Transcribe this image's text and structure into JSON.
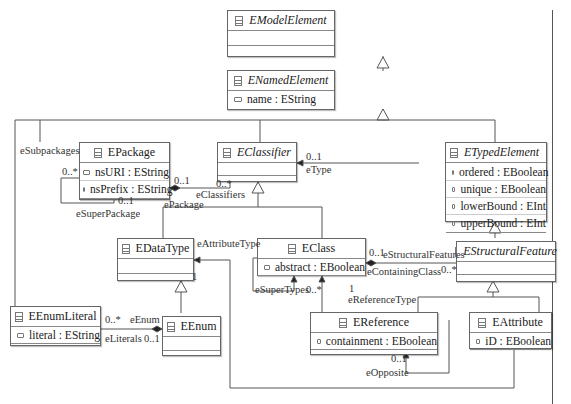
{
  "diagram": {
    "classes": {
      "emodelelement": {
        "name": "EModelElement",
        "abstract": true,
        "attributes": []
      },
      "enamedelement": {
        "name": "ENamedElement",
        "abstract": true,
        "attributes": [
          {
            "text": "name : EString"
          }
        ]
      },
      "epackage": {
        "name": "EPackage",
        "abstract": false,
        "attributes": [
          {
            "text": "nsURI : EString"
          },
          {
            "text": "nsPrefix : EString"
          }
        ]
      },
      "eclassifier": {
        "name": "EClassifier",
        "abstract": true,
        "attributes": []
      },
      "etypedelement": {
        "name": "ETypedElement",
        "abstract": true,
        "attributes": [
          {
            "text": "ordered : EBoolean"
          },
          {
            "text": "unique : EBoolean"
          },
          {
            "text": "lowerBound : EInt"
          },
          {
            "text": "upperBound : EInt"
          }
        ]
      },
      "edatatype": {
        "name": "EDataType",
        "abstract": false,
        "attributes": []
      },
      "eclass": {
        "name": "EClass",
        "abstract": false,
        "attributes": [
          {
            "text": "abstract : EBoolean"
          }
        ]
      },
      "estructuralfeature": {
        "name": "EStructuralFeature",
        "abstract": true,
        "attributes": []
      },
      "eenumliteral": {
        "name": "EEnumLiteral",
        "abstract": false,
        "attributes": [
          {
            "text": "literal : EString"
          }
        ]
      },
      "eenum": {
        "name": "EEnum",
        "abstract": false,
        "attributes": []
      },
      "ereference": {
        "name": "EReference",
        "abstract": false,
        "attributes": [
          {
            "text": "containment : EBoolean"
          }
        ]
      },
      "eattribute": {
        "name": "EAttribute",
        "abstract": false,
        "attributes": [
          {
            "text": "iD : EBoolean"
          }
        ]
      }
    },
    "labels": {
      "esubpackages": "eSubpackages",
      "esubpackages_mult": "0..*",
      "esuperpackage": "eSuperPackage",
      "esuperpackage_mult": "0..1",
      "epackage_mult": "0..1",
      "epackage": "ePackage",
      "eclassifiers": "eClassifiers",
      "eclassifiers_mult": "0..*",
      "etype_mult": "0..1",
      "etype": "eType",
      "eattributetype": "eAttributeType",
      "eattributetype_mult": "1",
      "estructuralfeatures_mult": "0..1",
      "estructuralfeatures": "eStructuralFeatures",
      "econtainingclass": "eContainingClass",
      "econtainingclass_mult": "0..*",
      "esupertypes": "eSuperTypes",
      "esupertypes_mult": "0..*",
      "ereferencetype_mult": "1",
      "ereferencetype": "eReferenceType",
      "eliterals_mult": "0..*",
      "eenum_role": "eEnum",
      "eliterals": "eLiterals",
      "eenum_mult": "0..1",
      "eopposite_mult": "0..1",
      "eopposite": "eOpposite"
    }
  }
}
